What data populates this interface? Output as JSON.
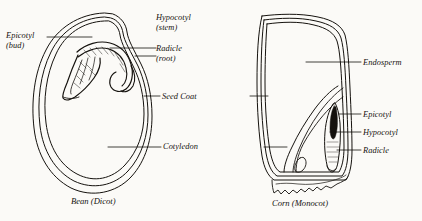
{
  "diagram": {
    "ink_color": "#15120e",
    "background_color": "#fbfaf7",
    "figures": [
      {
        "id": "bean",
        "caption": "Bean (Dicot)",
        "type": "dicot-seed-cross-section"
      },
      {
        "id": "corn",
        "caption": "Corn (Monocot)",
        "type": "monocot-seed-cross-section"
      }
    ],
    "labels": {
      "bean_epicotyl": "Epicotyl",
      "bean_epicotyl_sub": "(bud)",
      "bean_hypocotyl": "Hypocotyl",
      "bean_hypocotyl_sub": "(stem)",
      "bean_radicle": "Radicle",
      "bean_radicle_sub": "(root)",
      "seed_coat": "Seed Coat",
      "cotyledon": "Cotyledon",
      "corn_endosperm": "Endosperm",
      "corn_epicotyl": "Epicotyl",
      "corn_hypocotyl": "Hypocotyl",
      "corn_radicle": "Radicle"
    }
  }
}
